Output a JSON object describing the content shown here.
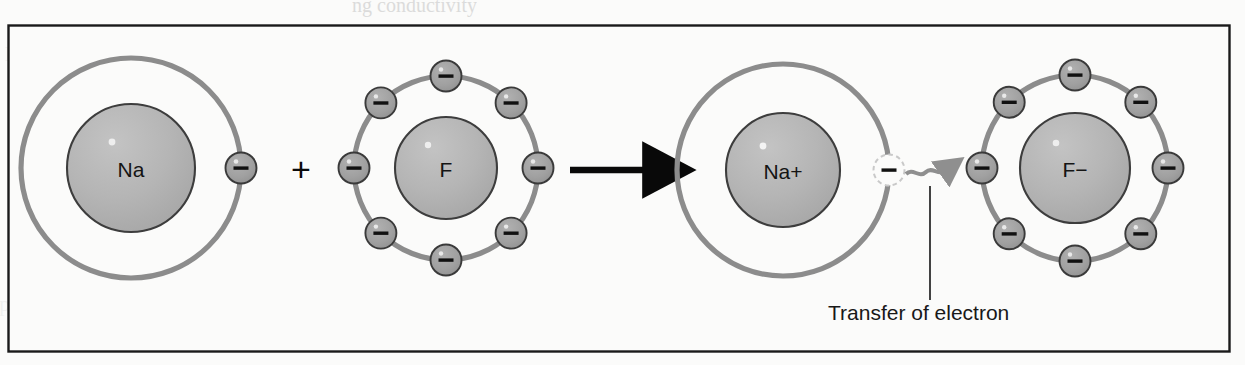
{
  "figure": {
    "title_fragment_top": "",
    "background_color": "#fbfbfa",
    "border_color": "#1a1a1a",
    "caption": "Transfer of electron"
  },
  "palette": {
    "shell_stroke": "#8c8c8c",
    "nucleus_fill": "#b4b4b4",
    "nucleus_stroke": "#3d3d3d",
    "electron_fill": "#a0a0a0",
    "electron_stroke": "#3a3a3a",
    "electron_sign": "#111111",
    "ghost_stroke": "#c9c9c9",
    "arrow_black": "#090909",
    "arrow_gray": "#8f8f8f",
    "leader_line": "#222222",
    "text_color": "#181818"
  },
  "chart_data": {
    "type": "diagram",
    "equation": "Na + F → Na+ + F−",
    "species": [
      {
        "id": "na-atom",
        "label": "Na",
        "role": "reactant",
        "charge": "neutral",
        "valence_electrons": 1,
        "electron_angles_deg": [
          0
        ],
        "shell_radius": 110,
        "nucleus_radius": 64,
        "center": [
          131,
          168
        ]
      },
      {
        "id": "f-atom",
        "label": "F",
        "role": "reactant",
        "charge": "neutral",
        "valence_electrons": 7,
        "electron_angles_deg": [
          0,
          45,
          90,
          180,
          225,
          270,
          315
        ],
        "shell_radius": 92,
        "nucleus_radius": 51,
        "center": [
          446,
          168
        ]
      },
      {
        "id": "na-ion",
        "label": "Na+",
        "role": "product",
        "charge": "positive",
        "valence_electrons": 0,
        "ghost_electron_angles_deg": [
          0
        ],
        "shell_radius": 106,
        "nucleus_radius": 57,
        "center": [
          783,
          170
        ]
      },
      {
        "id": "f-ion",
        "label": "F−",
        "role": "product",
        "charge": "negative",
        "valence_electrons": 8,
        "electron_angles_deg": [
          0,
          45,
          90,
          135,
          180,
          225,
          270,
          315
        ],
        "shell_radius": 93,
        "nucleus_radius": 55,
        "center": [
          1075,
          168
        ]
      }
    ],
    "operators": [
      {
        "id": "plus-operator",
        "symbol": "+",
        "position": [
          301,
          169
        ]
      }
    ],
    "arrows": [
      {
        "id": "reaction-arrow",
        "style": "solid-black",
        "from": [
          570,
          170
        ],
        "to": [
          664,
          170
        ],
        "meaning": "reacts to form"
      },
      {
        "id": "transfer-arrow",
        "style": "wavy-gray",
        "from": [
          906,
          172
        ],
        "to": [
          952,
          170
        ],
        "meaning": "electron moves from Na+ to F−"
      }
    ],
    "annotations": [
      {
        "id": "transfer-annotation",
        "text": "Transfer of electron",
        "text_position": [
          828,
          320
        ],
        "leader_from": [
          930,
          300
        ],
        "leader_to": [
          930,
          186
        ]
      }
    ],
    "electron_symbol": "−",
    "electron_radius": 15.5
  },
  "frame": {
    "x": 8,
    "y": 25,
    "width": 1221,
    "height": 326
  },
  "bleed_text": [
    {
      "id": "bleed-top-1",
      "text": "ng conductivity",
      "x": 352,
      "y": -6,
      "size": 20,
      "opacity": 0.5
    },
    {
      "id": "bleed-left-1",
      "text": "tion is.  Ionic  compounds",
      "x": -58,
      "y": 42,
      "size": 21,
      "opacity": 0.16
    },
    {
      "id": "bleed-left-2",
      "text": "ction  produces  a  solid",
      "x": -48,
      "y": 292,
      "size": 21,
      "opacity": 0.16
    },
    {
      "id": "bleed-right-1",
      "text": "solid  resulting  from  the",
      "x": 600,
      "y": 42,
      "size": 21,
      "opacity": 0.16
    },
    {
      "id": "bleed-right-2",
      "text": "n  as  well  as  the",
      "x": 600,
      "y": 78,
      "size": 21,
      "opacity": 0.16
    },
    {
      "id": "bleed-mid-1",
      "text": "of  the  solid  sodium",
      "x": 530,
      "y": 248,
      "size": 21,
      "opacity": 0.13
    },
    {
      "id": "bleed-mid-2",
      "text": "moved  by  a  solution",
      "x": 520,
      "y": 284,
      "size": 21,
      "opacity": 0.13
    }
  ]
}
